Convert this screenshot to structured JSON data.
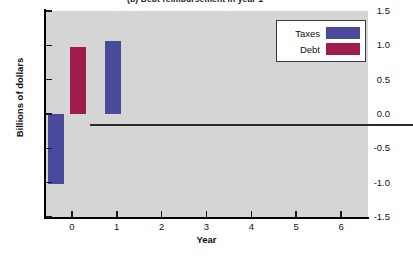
{
  "chart_data": {
    "type": "bar",
    "title": "(b) Debt reimbursement in year 1",
    "xlabel": "Year",
    "ylabel": "Billions of dollars",
    "xlim": [
      -0.6,
      6.6
    ],
    "ylim": [
      -1.5,
      1.5
    ],
    "xticks": [
      "0",
      "1",
      "2",
      "3",
      "4",
      "5",
      "6"
    ],
    "xtick_values": [
      0,
      1,
      2,
      3,
      4,
      5,
      6
    ],
    "yticks": [
      "1.5",
      "1.0",
      "0.5",
      "0.0",
      "-0.5",
      "-1.0",
      "-1.5"
    ],
    "ytick_values": [
      1.5,
      1.0,
      0.5,
      0.0,
      -0.5,
      -1.0,
      -1.5
    ],
    "grid": false,
    "legend_position": "top-right",
    "series": [
      {
        "name": "Taxes",
        "color": "#4a4a9c",
        "x": [
          0,
          1
        ],
        "values": [
          -1.02,
          1.07
        ]
      },
      {
        "name": "Debt",
        "color": "#9f1b4b",
        "x": [
          0
        ],
        "values": [
          0.97
        ]
      }
    ],
    "bars": [
      {
        "series": "Debt",
        "x": 0,
        "value": 0.97,
        "color": "#9f1b4b"
      },
      {
        "series": "Taxes",
        "x": 0,
        "value": -1.02,
        "color": "#4a4a9c"
      },
      {
        "series": "Taxes",
        "x": 1,
        "value": 1.07,
        "color": "#4a4a9c"
      }
    ],
    "colors": {
      "taxes": "#4a4a9c",
      "debt": "#9f1b4b",
      "plot_background": "#d5d5d5",
      "figure_background": "#ffffff",
      "axis": "#000000",
      "zero_line": "#2b2b2b"
    }
  },
  "legend": {
    "entries": [
      {
        "label": "Taxes",
        "color": "#4a4a9c"
      },
      {
        "label": "Debt",
        "color": "#9f1b4b"
      }
    ]
  }
}
